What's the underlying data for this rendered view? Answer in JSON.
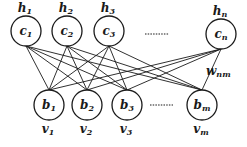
{
  "diagram": {
    "type": "bipartite-network",
    "top_layer": {
      "nodes": [
        {
          "id": "c1",
          "label": "c",
          "sub": "1",
          "outer_label": "h",
          "outer_sub": "1",
          "cx": 26,
          "cy": 31
        },
        {
          "id": "c2",
          "label": "c",
          "sub": "2",
          "outer_label": "h",
          "outer_sub": "2",
          "cx": 67,
          "cy": 31
        },
        {
          "id": "c3",
          "label": "c",
          "sub": "3",
          "outer_label": "h",
          "outer_sub": "3",
          "cx": 109,
          "cy": 31
        },
        {
          "id": "cn",
          "label": "c",
          "sub": "n",
          "outer_label": "h",
          "outer_sub": "n",
          "cx": 221,
          "cy": 34
        }
      ],
      "ellipsis": "......."
    },
    "bottom_layer": {
      "nodes": [
        {
          "id": "b1",
          "label": "b",
          "sub": "1",
          "outer_label": "v",
          "outer_sub": "1",
          "cx": 49,
          "cy": 105
        },
        {
          "id": "b2",
          "label": "b",
          "sub": "2",
          "outer_label": "v",
          "outer_sub": "2",
          "cx": 87,
          "cy": 105
        },
        {
          "id": "b3",
          "label": "b",
          "sub": "3",
          "outer_label": "v",
          "outer_sub": "3",
          "cx": 127,
          "cy": 105
        },
        {
          "id": "bm",
          "label": "b",
          "sub": "m",
          "outer_label": "v",
          "outer_sub": "m",
          "cx": 202,
          "cy": 105
        }
      ],
      "ellipsis": "......."
    },
    "weight_label": {
      "text": "w",
      "sub": "nm"
    },
    "connectivity": "all-to-all",
    "radius": 15
  }
}
